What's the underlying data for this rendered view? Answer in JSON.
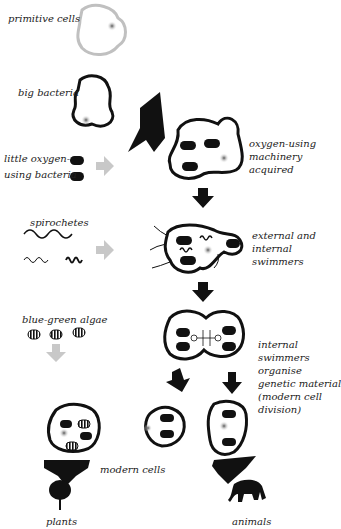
{
  "diagram": {
    "type": "serial endosymbiosis flow diagram",
    "labels": {
      "primitive_cells": "primitive cells",
      "big_bacteria": "big bacteria",
      "little_bacteria_1": "little oxygen-",
      "little_bacteria_2": "using bacteria",
      "oxygen_1": "oxygen-using",
      "oxygen_2": "machinery",
      "oxygen_3": "acquired",
      "spirochetes": "spirochetes",
      "swimmers_1": "external and",
      "swimmers_2": "internal",
      "swimmers_3": "swimmers",
      "algae": "blue-green algae",
      "organise_1": "internal",
      "organise_2": "swimmers",
      "organise_3": "organise",
      "organise_4": "genetic material",
      "organise_5": "(modern cell",
      "organise_6": "division)",
      "modern_cells": "modern cells",
      "plants": "plants",
      "animals": "animals"
    },
    "colors": {
      "ink": "#111111",
      "grey_arrow": "#c8c8c8",
      "primitive_outline": "#c0c0c0",
      "nucleus": "#888888"
    }
  }
}
